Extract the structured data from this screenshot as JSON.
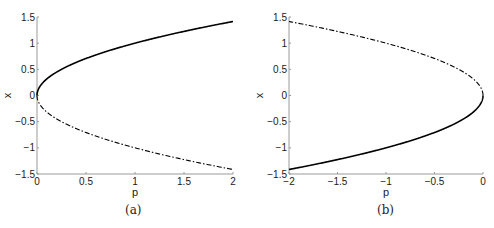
{
  "chart_data": [
    {
      "id": "a",
      "type": "line",
      "caption": "(a)",
      "title": "",
      "xlabel": "p",
      "ylabel": "x",
      "xlim": [
        0,
        2
      ],
      "ylim": [
        -1.5,
        1.5
      ],
      "xticks": [
        0,
        0.5,
        1,
        1.5,
        2
      ],
      "xtick_labels": [
        "0",
        "0.5",
        "1",
        "1.5",
        "2"
      ],
      "yticks": [
        -1.5,
        -1,
        -0.5,
        0,
        0.5,
        1,
        1.5
      ],
      "ytick_labels": [
        "-1.5",
        "-1",
        "-0.5",
        "0",
        "0.5",
        "1",
        "1.5"
      ],
      "grid": false,
      "legend": null,
      "series": [
        {
          "name": "stable branch x = +sqrt(p)",
          "style": "solid",
          "x": [
            0,
            0.01,
            0.05,
            0.1,
            0.25,
            0.5,
            0.75,
            1,
            1.25,
            1.5,
            1.75,
            2
          ],
          "y": [
            0,
            0.1,
            0.224,
            0.316,
            0.5,
            0.707,
            0.866,
            1,
            1.118,
            1.225,
            1.323,
            1.414
          ]
        },
        {
          "name": "unstable branch x = -sqrt(p)",
          "style": "dash-dot",
          "x": [
            0,
            0.01,
            0.05,
            0.1,
            0.25,
            0.5,
            0.75,
            1,
            1.25,
            1.5,
            1.75,
            2
          ],
          "y": [
            0,
            -0.1,
            -0.224,
            -0.316,
            -0.5,
            -0.707,
            -0.866,
            -1,
            -1.118,
            -1.225,
            -1.323,
            -1.414
          ]
        }
      ]
    },
    {
      "id": "b",
      "type": "line",
      "caption": "(b)",
      "title": "",
      "xlabel": "p",
      "ylabel": "x",
      "xlim": [
        -2,
        0
      ],
      "ylim": [
        -1.5,
        1.5
      ],
      "xticks": [
        -2,
        -1.5,
        -1,
        -0.5,
        0
      ],
      "xtick_labels": [
        "-2",
        "-1.5",
        "-1",
        "-0.5",
        "0"
      ],
      "yticks": [
        -1.5,
        -1,
        -0.5,
        0,
        0.5,
        1,
        1.5
      ],
      "ytick_labels": [
        "-1.5",
        "-1",
        "-0.5",
        "0",
        "0.5",
        "1",
        "1.5"
      ],
      "grid": false,
      "legend": null,
      "series": [
        {
          "name": "unstable branch x = +sqrt(-p)",
          "style": "dash-dot",
          "x": [
            0,
            -0.01,
            -0.05,
            -0.1,
            -0.25,
            -0.5,
            -0.75,
            -1,
            -1.25,
            -1.5,
            -1.75,
            -2
          ],
          "y": [
            0,
            0.1,
            0.224,
            0.316,
            0.5,
            0.707,
            0.866,
            1,
            1.118,
            1.225,
            1.323,
            1.414
          ]
        },
        {
          "name": "stable branch x = -sqrt(-p)",
          "style": "solid",
          "x": [
            0,
            -0.01,
            -0.05,
            -0.1,
            -0.25,
            -0.5,
            -0.75,
            -1,
            -1.25,
            -1.5,
            -1.75,
            -2
          ],
          "y": [
            0,
            -0.1,
            -0.224,
            -0.316,
            -0.5,
            -0.707,
            -0.866,
            -1,
            -1.118,
            -1.225,
            -1.323,
            -1.414
          ]
        }
      ]
    }
  ],
  "colors": {
    "line": "#000000",
    "axis": "#9a9a9a",
    "text": "#1a1a1a"
  }
}
